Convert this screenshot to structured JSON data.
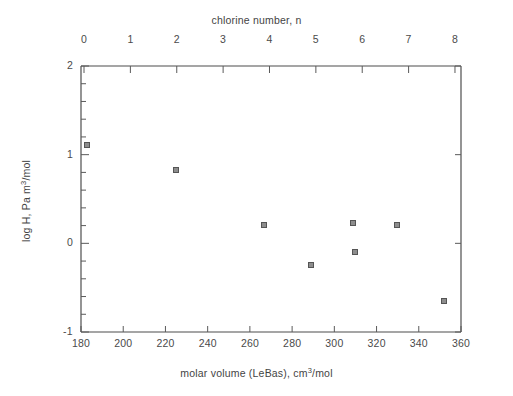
{
  "figure": {
    "background": "#ffffff",
    "axis_color": "#4d4d4d",
    "marker_fill": "#8d8d8d",
    "marker_edge": "#555555"
  },
  "axes": {
    "top": {
      "title": "chlorine number, n",
      "ticks": [
        "0",
        "1",
        "2",
        "3",
        "4",
        "5",
        "6",
        "7",
        "8"
      ]
    },
    "bottom": {
      "title_part1": "molar volume (LeBas), cm",
      "title_sup": "3",
      "title_part2": "/mol",
      "ticks": [
        "180",
        "200",
        "220",
        "240",
        "260",
        "280",
        "300",
        "320",
        "340",
        "360"
      ]
    },
    "left": {
      "title_part1": "log H, Pa m",
      "title_sup": "3",
      "title_part2": "/mol",
      "ticks": [
        "2",
        "1",
        "0",
        "-1"
      ]
    }
  },
  "chart_data": {
    "type": "scatter",
    "title": "",
    "xlabel": "molar volume (LeBas), cm3/mol",
    "ylabel": "log H, Pa m3/mol",
    "x2label": "chlorine number, n",
    "xlim": [
      180,
      360
    ],
    "ylim": [
      -1,
      2
    ],
    "x2lim": [
      -0.065,
      8.13
    ],
    "xticks": [
      180,
      200,
      220,
      240,
      260,
      280,
      300,
      320,
      340,
      360
    ],
    "yticks": [
      -1,
      0,
      1,
      2
    ],
    "yminorstep": 0.2,
    "x2ticks": [
      0,
      1,
      2,
      3,
      4,
      5,
      6,
      7,
      8
    ],
    "grid": false,
    "legend": "none",
    "marker": "square",
    "series": [
      {
        "name": "chlorobenzenes",
        "points": [
          {
            "x": 183,
            "y": 1.1,
            "n": 0
          },
          {
            "x": 225,
            "y": 0.82,
            "n": 1
          },
          {
            "x": 267,
            "y": 0.2,
            "n": 2
          },
          {
            "x": 289,
            "y": -0.25,
            "n": 3
          },
          {
            "x": 309,
            "y": 0.22,
            "n": 4
          },
          {
            "x": 310,
            "y": -0.1,
            "n": 4
          },
          {
            "x": 330,
            "y": 0.2,
            "n": 5
          },
          {
            "x": 352,
            "y": -0.66,
            "n": 6
          }
        ]
      }
    ]
  }
}
